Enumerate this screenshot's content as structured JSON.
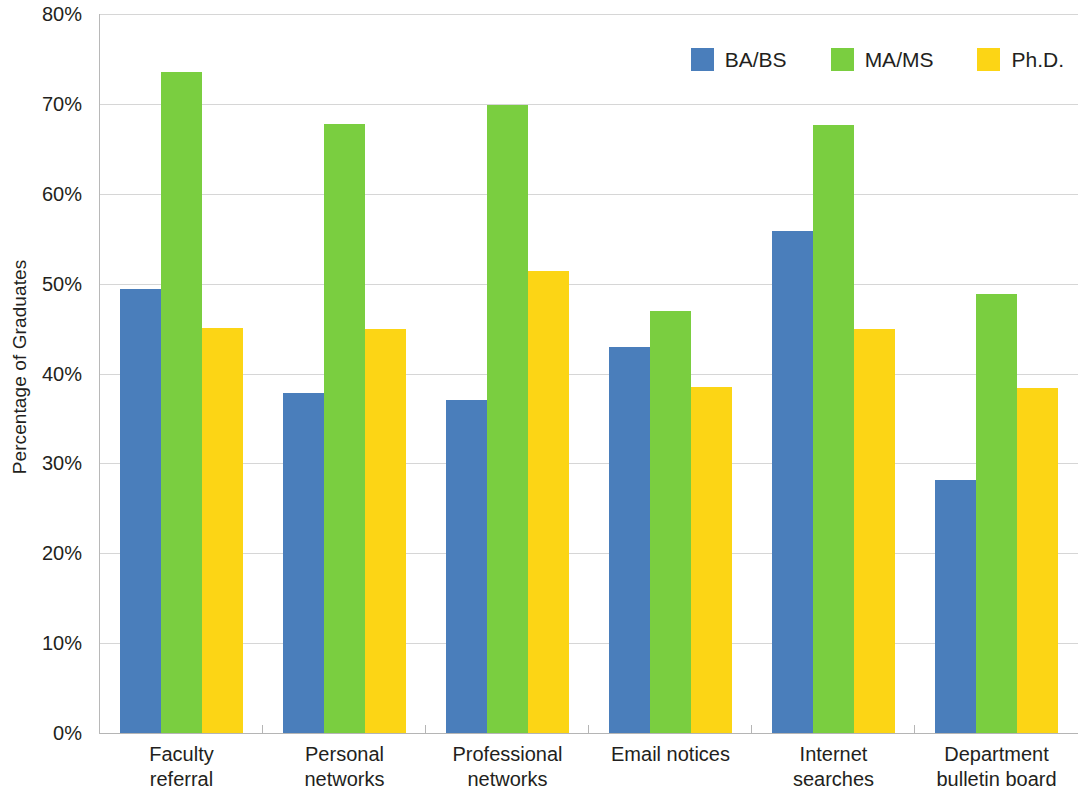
{
  "chart_data": {
    "type": "bar",
    "title": "",
    "xlabel": "",
    "ylabel": "Percentage of Graduates",
    "ylim": [
      0,
      80
    ],
    "ytick_labels": [
      "0%",
      "10%",
      "20%",
      "30%",
      "40%",
      "50%",
      "60%",
      "70%",
      "80%"
    ],
    "ytick_values": [
      0,
      10,
      20,
      30,
      40,
      50,
      60,
      70,
      80
    ],
    "grid": true,
    "legend_position": "top-right",
    "categories": [
      "Faculty referral",
      "Personal networks",
      "Professional networks",
      "Email notices",
      "Internet searches",
      "Department bulletin board"
    ],
    "category_lines": [
      [
        "Faculty",
        "referral"
      ],
      [
        "Personal",
        "networks"
      ],
      [
        "Professional",
        "networks"
      ],
      [
        "Email notices"
      ],
      [
        "Internet",
        "searches"
      ],
      [
        "Department",
        "bulletin board"
      ]
    ],
    "series": [
      {
        "name": "BA/BS",
        "color": "#4a7ebb",
        "values": [
          49.4,
          37.8,
          37.0,
          42.9,
          55.9,
          28.2
        ]
      },
      {
        "name": "MA/MS",
        "color": "#7ace40",
        "values": [
          73.6,
          67.8,
          69.9,
          47.0,
          67.6,
          48.8
        ]
      },
      {
        "name": "Ph.D.",
        "color": "#fcd515",
        "values": [
          45.1,
          45.0,
          51.4,
          38.5,
          44.9,
          38.4
        ]
      }
    ]
  },
  "axis": {
    "y_title": "Percentage of Graduates"
  },
  "legend": {
    "items": [
      {
        "label": "BA/BS",
        "color": "#4a7ebb"
      },
      {
        "label": "MA/MS",
        "color": "#7ace40"
      },
      {
        "label": "Ph.D.",
        "color": "#fcd515"
      }
    ]
  }
}
